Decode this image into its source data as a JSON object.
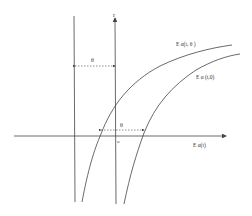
{
  "diagram": {
    "axis_labels": {
      "vertical_top": "r",
      "horizontal_right": "E α(t)",
      "origin": "o"
    },
    "curve_labels": {
      "upper_curve": "E α(t, θ )",
      "lower_curve": "E α (t,0)"
    },
    "shift_labels": {
      "top": "θ",
      "bottom": "θ"
    },
    "colors": {
      "line": "#444444",
      "background": "#ffffff"
    }
  }
}
